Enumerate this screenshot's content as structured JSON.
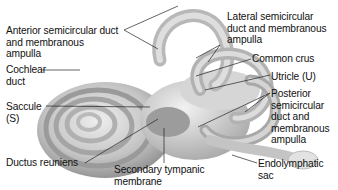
{
  "figure": {
    "labels": {
      "anterior": "Anterior semicircular duct\nand membranous\nampulla",
      "lateral": "Lateral semicircular\nduct and membranous\nampulla",
      "common_crus": "Common crus",
      "cochlear": "Cochlear\nduct",
      "utricle": "Utricle (U)",
      "saccule": "Saccule\n(S)",
      "posterior": "Posterior\nsemicircular\nduct and\nmembranous\nampulla",
      "ductus": "Ductus reuniens",
      "secondary": "Secondary tympanic\nmembrane",
      "endolymphatic": "Endolymphatic\nsac"
    },
    "colors": {
      "structure_light": "#e6e6e6",
      "structure_mid": "#bdbdbd",
      "structure_dark": "#7a7a7a",
      "leader_line": "#222222",
      "text": "#111111"
    }
  }
}
